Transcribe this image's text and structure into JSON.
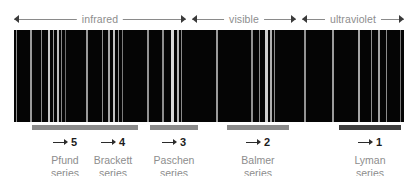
{
  "figure": {
    "background_color": "#ffffff",
    "band_color": "#050505",
    "label_color": "#8d8d8d",
    "arrow_color": "#2b2b2b"
  },
  "regions": [
    {
      "label": "infrared",
      "left": 14,
      "width": 172,
      "arrow": "double-headed"
    },
    {
      "label": "visible",
      "left": 192,
      "width": 104,
      "arrow": "double-headed"
    },
    {
      "label": "ultraviolet",
      "left": 302,
      "width": 102,
      "arrow": "double-headed"
    }
  ],
  "spectrum": {
    "left": 14,
    "top": 30,
    "width": 390,
    "height": 92,
    "lines": [
      {
        "x": 2,
        "w": 1.3,
        "c": "#8e8e8e"
      },
      {
        "x": 16,
        "w": 1.6,
        "c": "#9a9a9a"
      },
      {
        "x": 27,
        "w": 1.3,
        "c": "#8a8a8a"
      },
      {
        "x": 34,
        "w": 2.2,
        "c": "#c9c9c9"
      },
      {
        "x": 39,
        "w": 1.3,
        "c": "#9f9f9f"
      },
      {
        "x": 43,
        "w": 1.6,
        "c": "#bdbdbd"
      },
      {
        "x": 47,
        "w": 1.2,
        "c": "#8a8a8a"
      },
      {
        "x": 51,
        "w": 1.1,
        "c": "#6e6e6e"
      },
      {
        "x": 72,
        "w": 1.5,
        "c": "#9a9a9a"
      },
      {
        "x": 88,
        "w": 1.4,
        "c": "#8f8f8f"
      },
      {
        "x": 94,
        "w": 1.6,
        "c": "#a8a8a8"
      },
      {
        "x": 99,
        "w": 2.0,
        "c": "#c4c4c4"
      },
      {
        "x": 104,
        "w": 1.4,
        "c": "#9b9b9b"
      },
      {
        "x": 108,
        "w": 1.2,
        "c": "#7d7d7d"
      },
      {
        "x": 133,
        "w": 1.5,
        "c": "#939393"
      },
      {
        "x": 148,
        "w": 1.5,
        "c": "#8e8e8e"
      },
      {
        "x": 157,
        "w": 3.0,
        "c": "#d8d8d8"
      },
      {
        "x": 163,
        "w": 2.0,
        "c": "#b4b4b4"
      },
      {
        "x": 167,
        "w": 1.4,
        "c": "#8c8c8c"
      },
      {
        "x": 202,
        "w": 1.6,
        "c": "#9b9b9b"
      },
      {
        "x": 237,
        "w": 1.5,
        "c": "#929292"
      },
      {
        "x": 245,
        "w": 1.3,
        "c": "#8a8a8a"
      },
      {
        "x": 251,
        "w": 2.6,
        "c": "#d0d0d0"
      },
      {
        "x": 256,
        "w": 2.0,
        "c": "#b0b0b0"
      },
      {
        "x": 260,
        "w": 1.4,
        "c": "#8d8d8d"
      },
      {
        "x": 290,
        "w": 1.5,
        "c": "#949494"
      },
      {
        "x": 318,
        "w": 1.6,
        "c": "#9c9c9c"
      },
      {
        "x": 344,
        "w": 1.8,
        "c": "#a6a6a6"
      },
      {
        "x": 357,
        "w": 1.4,
        "c": "#8e8e8e"
      },
      {
        "x": 364,
        "w": 1.8,
        "c": "#a4a4a4"
      },
      {
        "x": 372,
        "w": 1.4,
        "c": "#8c8c8c"
      },
      {
        "x": 386,
        "w": 1.2,
        "c": "#7a7a7a"
      }
    ]
  },
  "series": [
    {
      "number": "5",
      "name_line1": "Pfund",
      "name_line2": "series",
      "bar_left": 18,
      "bar_width": 66,
      "bar_color": "#8b8b8b",
      "cap_left": 14,
      "cap_width": 74
    },
    {
      "number": "4",
      "name_line1": "Brackett",
      "name_line2": "series",
      "bar_left": 74,
      "bar_width": 50,
      "bar_color": "#8b8b8b",
      "cap_left": 69,
      "cap_width": 60
    },
    {
      "number": "3",
      "name_line1": "Paschen",
      "name_line2": "series",
      "bar_left": 136,
      "bar_width": 48,
      "bar_color": "#8b8b8b",
      "cap_left": 132,
      "cap_width": 56
    },
    {
      "number": "2",
      "name_line1": "Balmer",
      "name_line2": "series",
      "bar_left": 213,
      "bar_width": 62,
      "bar_color": "#8b8b8b",
      "cap_left": 214,
      "cap_width": 60
    },
    {
      "number": "1",
      "name_line1": "Lyman",
      "name_line2": "series",
      "bar_left": 325,
      "bar_width": 62,
      "bar_color": "#3f3f3f",
      "cap_left": 326,
      "cap_width": 60
    }
  ]
}
